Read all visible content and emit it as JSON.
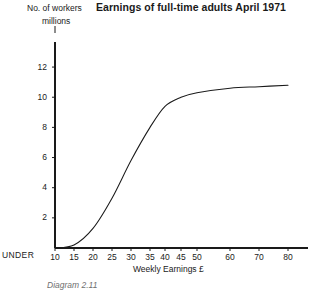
{
  "chart_data": {
    "type": "line",
    "title": "Earnings of full-time adults April 1971",
    "subtitle": "",
    "xlabel": "Weekly Earnings £",
    "ylabel": "No. of workers millions",
    "ylabel_lines": [
      "No. of workers",
      "millions"
    ],
    "caption": "Diagram 2.11",
    "grid": false,
    "legend": "none",
    "x_axis_note": "UNDER",
    "xlim": [
      10,
      85
    ],
    "ylim": [
      0,
      13
    ],
    "xticks": [
      10,
      15,
      20,
      25,
      30,
      35,
      40,
      45,
      50,
      60,
      70,
      80
    ],
    "xtick_labels": [
      "10",
      "15",
      "20",
      "25",
      "30",
      "35",
      "40",
      "45",
      "50",
      "60",
      "70",
      "80"
    ],
    "yticks": [
      2,
      4,
      6,
      8,
      10,
      12
    ],
    "ytick_labels": [
      "2",
      "4",
      "6",
      "8",
      "10",
      "12"
    ],
    "series": [
      {
        "name": "Cumulative number of full-time adults",
        "x": [
          10,
          15,
          20,
          25,
          30,
          35,
          40,
          45,
          50,
          60,
          70,
          80
        ],
        "values": [
          0.0,
          0.2,
          1.3,
          3.3,
          5.8,
          8.0,
          9.4,
          10.0,
          10.3,
          10.6,
          10.7,
          10.8
        ]
      }
    ]
  },
  "axis": {
    "under_label": "UNDER"
  }
}
